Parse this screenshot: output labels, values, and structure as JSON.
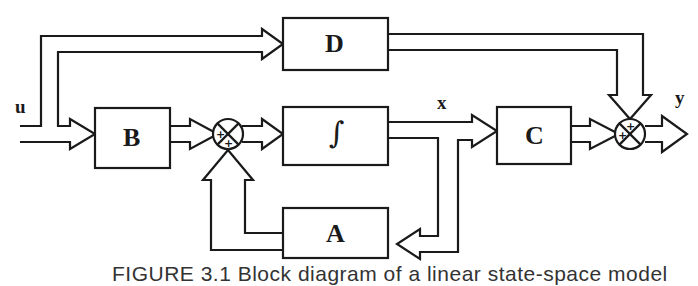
{
  "diagram": {
    "type": "state-space block diagram",
    "blocks": {
      "D": "D",
      "B": "B",
      "integrator": "∫",
      "C": "C",
      "A": "A"
    },
    "signals": {
      "input": "u",
      "state": "x",
      "output": "y"
    },
    "summing_junctions": {
      "sum1_signs": [
        "+",
        "+"
      ],
      "sum2_signs": [
        "+",
        "+"
      ]
    },
    "caption": "FIGURE 3.1  Block diagram of a linear state-space model"
  },
  "colors": {
    "stroke": "#1a1a1a",
    "background": "#ffffff"
  }
}
